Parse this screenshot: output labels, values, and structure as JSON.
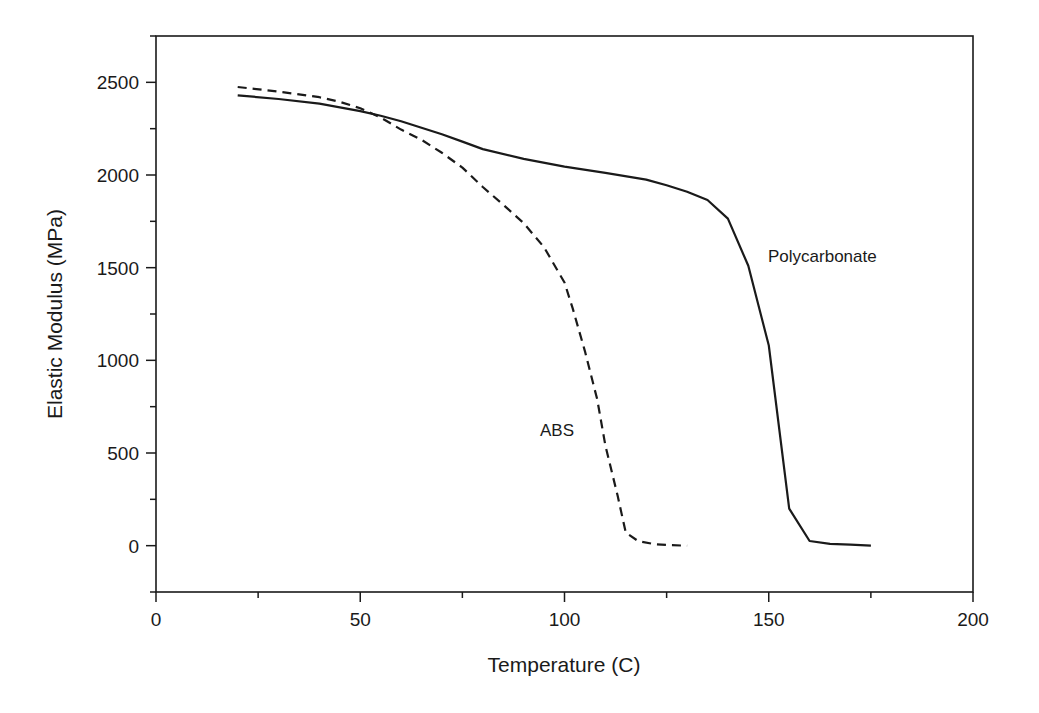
{
  "chart_data": {
    "type": "line",
    "title": "",
    "xlabel": "Temperature (C)",
    "ylabel": "Elastic Modulus (MPa)",
    "xlim": [
      0,
      200
    ],
    "ylim": [
      -250,
      2750
    ],
    "xticks": [
      0,
      50,
      100,
      150,
      200
    ],
    "xminor_step": 25,
    "yticks": [
      0,
      500,
      1000,
      1500,
      2000,
      2500
    ],
    "yminor_step": 250,
    "grid": false,
    "legend": "none (curves labeled directly)",
    "series": [
      {
        "name": "Polycarbonate",
        "style": "solid",
        "color": "#1a1a1a",
        "x": [
          20,
          30,
          40,
          50,
          55,
          60,
          65,
          70,
          75,
          80,
          90,
          100,
          110,
          120,
          125,
          130,
          135,
          140,
          145,
          150,
          155,
          160,
          165,
          170,
          175
        ],
        "y": [
          2430,
          2410,
          2385,
          2345,
          2320,
          2290,
          2255,
          2220,
          2180,
          2140,
          2087,
          2045,
          2012,
          1975,
          1945,
          1910,
          1865,
          1765,
          1510,
          1080,
          200,
          25,
          10,
          5,
          0
        ]
      },
      {
        "name": "ABS",
        "style": "dashed",
        "color": "#1a1a1a",
        "x": [
          20,
          30,
          40,
          45,
          50,
          55,
          60,
          65,
          70,
          75,
          80,
          85,
          90,
          95,
          100,
          102,
          105,
          108,
          110,
          113,
          115,
          118,
          122,
          126,
          130
        ],
        "y": [
          2475,
          2450,
          2420,
          2395,
          2360,
          2310,
          2245,
          2190,
          2120,
          2040,
          1935,
          1840,
          1740,
          1610,
          1420,
          1280,
          1050,
          790,
          540,
          270,
          70,
          25,
          8,
          3,
          0
        ]
      }
    ],
    "annotations": [
      {
        "text": "Polycarbonate",
        "x": 150,
        "y": 1550
      },
      {
        "text": "ABS",
        "x": 93,
        "y": 620
      }
    ]
  },
  "labels": {
    "xlabel": "Temperature (C)",
    "ylabel": "Elastic Modulus (MPa)",
    "pc_label": "Polycarbonate",
    "abs_label": "ABS"
  }
}
